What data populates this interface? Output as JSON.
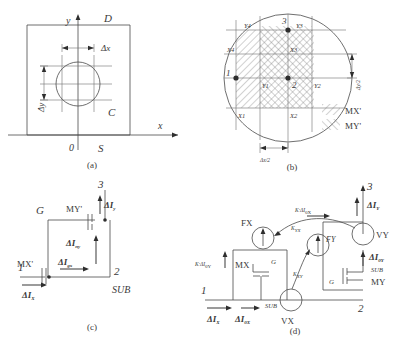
{
  "figure": {
    "panels": [
      {
        "id": "a",
        "caption": "(a)"
      },
      {
        "id": "b",
        "caption": "(b)"
      },
      {
        "id": "c",
        "caption": "(c)"
      },
      {
        "id": "d",
        "caption": "(d)"
      }
    ]
  },
  "panel_a": {
    "caption": "(a)",
    "axis_x": "x",
    "axis_y": "y",
    "origin": "0",
    "region_top": "D",
    "region_right": "C",
    "region_bottom": "S",
    "dim_dx": "Δx",
    "dim_dy": "Δy"
  },
  "panel_b": {
    "caption": "(b)",
    "node_1": "1",
    "node_2": "2",
    "node_3": "3",
    "grid_labels": {
      "y_top_left": "Y4",
      "y_top_right": "Y3",
      "x_left_upper": "X4",
      "x_center_upper": "X3",
      "y_center_left": "Y1",
      "y_center_right": "Y2",
      "x_left_lower": "X1",
      "x_center_lower": "X2"
    },
    "legend": [
      {
        "key": "MX'",
        "hatch": "forward"
      },
      {
        "key": "MY'",
        "hatch": "backward"
      }
    ],
    "dim_dx_half": "Δx/2",
    "dim_dy_half": "Δy/2"
  },
  "panel_c": {
    "caption": "(c)",
    "node_1": "1",
    "node_2": "2",
    "node_3": "3",
    "device_mx": "MX'",
    "device_my": "MY'",
    "gate": "G",
    "substrate": "SUB",
    "current_in": "ΔI",
    "current_in_sub": "X",
    "current_gx": "ΔI",
    "current_gx_sub": "gx",
    "current_ny": "ΔI",
    "current_ny_sub": "ny",
    "current_y": "ΔI",
    "current_y_sub": "y"
  },
  "panel_d": {
    "caption": "(d)",
    "node_1": "1",
    "node_2": "2",
    "node_3": "3",
    "device_mx": "MX",
    "device_my": "MY",
    "gate": "G",
    "substrate": "SUB",
    "source_fx": "FX",
    "source_fy": "FY",
    "source_vx": "VX",
    "source_vy": "VY",
    "coef_yx": "K",
    "coef_yx_sub": "YX",
    "coef_xy": "K",
    "coef_xy_sub": "XY",
    "expr_left": "K·ΔI",
    "expr_left_sub1": "YX",
    "expr_left_sub2": "0Y",
    "expr_top": "K·ΔI",
    "expr_top_sub1": "XY",
    "expr_top_sub2": "0X",
    "current_x": "ΔI",
    "current_x_sub": "X",
    "current_0x": "ΔI",
    "current_0x_sub": "0X",
    "current_y": "ΔI",
    "current_y_sub": "Y",
    "current_0y": "ΔI",
    "current_0y_sub": "0Y"
  }
}
